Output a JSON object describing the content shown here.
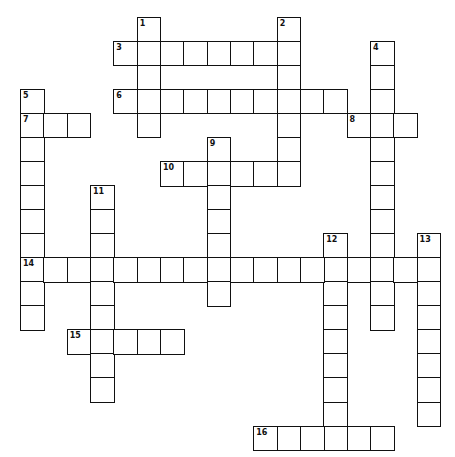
{
  "puzzle": {
    "type": "crossword",
    "grid": {
      "origin_x": 20,
      "origin_y": 16.7,
      "cell_w": 23.33,
      "cell_h": 24.05,
      "cols": 18,
      "rows": 18
    },
    "colors": {
      "line": "#111111",
      "cell_bg": "#ffffff",
      "page_bg": "#ffffff"
    },
    "words": [
      {
        "number": "1",
        "direction": "down",
        "row": 0,
        "col": 5,
        "length": 5
      },
      {
        "number": "2",
        "direction": "down",
        "row": 0,
        "col": 11,
        "length": 7
      },
      {
        "number": "3",
        "direction": "across",
        "row": 1,
        "col": 4,
        "length": 8
      },
      {
        "number": "4",
        "direction": "down",
        "row": 1,
        "col": 15,
        "length": 12
      },
      {
        "number": "5",
        "direction": "down",
        "row": 3,
        "col": 0,
        "length": 10
      },
      {
        "number": "6",
        "direction": "across",
        "row": 3,
        "col": 4,
        "length": 10
      },
      {
        "number": "7",
        "direction": "across",
        "row": 4,
        "col": 0,
        "length": 3
      },
      {
        "number": "8",
        "direction": "across",
        "row": 4,
        "col": 14,
        "length": 3
      },
      {
        "number": "9",
        "direction": "down",
        "row": 5,
        "col": 8,
        "length": 7
      },
      {
        "number": "10",
        "direction": "across",
        "row": 6,
        "col": 6,
        "length": 6
      },
      {
        "number": "11",
        "direction": "down",
        "row": 7,
        "col": 3,
        "length": 9
      },
      {
        "number": "12",
        "direction": "down",
        "row": 9,
        "col": 13,
        "length": 9
      },
      {
        "number": "13",
        "direction": "down",
        "row": 9,
        "col": 17,
        "length": 8
      },
      {
        "number": "14",
        "direction": "across",
        "row": 10,
        "col": 0,
        "length": 18
      },
      {
        "number": "15",
        "direction": "across",
        "row": 13,
        "col": 2,
        "length": 5
      },
      {
        "number": "16",
        "direction": "across",
        "row": 17,
        "col": 10,
        "length": 6
      }
    ]
  }
}
